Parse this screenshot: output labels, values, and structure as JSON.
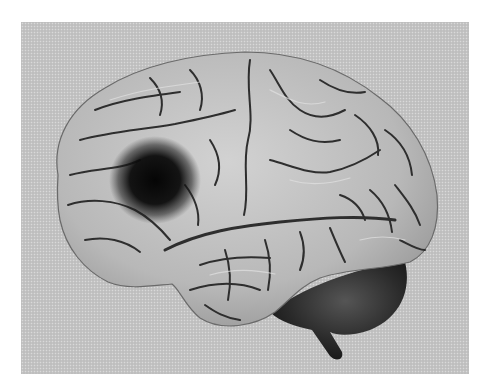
{
  "image": {
    "subject": "Lateral view of human brain with dark lesion in frontal lobe",
    "style": "greyscale illustration on dithered grey background",
    "colors": {
      "background": "#c4c4c4",
      "cortex": "#b9b9b9",
      "cortex_highlight": "#d6d6d6",
      "sulci": "#2e2e2e",
      "lesion": "#0a0a0a",
      "cerebellum": "#2a2a2a"
    },
    "regions": [
      {
        "name": "frontal-lobe-lesion",
        "cx": 155,
        "cy": 180,
        "r": 42
      },
      {
        "name": "cerebral-cortex"
      },
      {
        "name": "temporal-lobe"
      },
      {
        "name": "cerebellum"
      },
      {
        "name": "brainstem"
      }
    ]
  }
}
